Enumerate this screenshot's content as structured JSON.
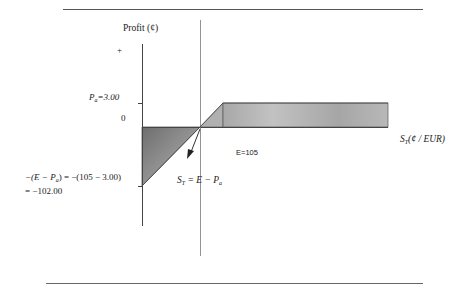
{
  "diagram": {
    "type": "option-payoff",
    "y_axis_label": "Profit (¢)",
    "plus_sign": "+",
    "premium_label": "P",
    "premium_sub": "a",
    "premium_value": "=3.00",
    "zero_label": "0",
    "strike_label": "E=105",
    "x_axis_label_S": "S",
    "x_axis_label_sub": "T",
    "x_axis_label_units": "(¢ / EUR)",
    "breakeven_lhs_S": "S",
    "breakeven_lhs_sub": "T",
    "breakeven_rhs": " = E − P",
    "breakeven_rhs_sub": "a",
    "max_loss_line1_a": "−(E − P",
    "max_loss_line1_sub": "a",
    "max_loss_line1_b": ") = −(105 − 3.00)",
    "max_loss_line2": "= −102.00",
    "strike": 105,
    "premium": 3.0,
    "max_loss": -102.0
  },
  "colors": {
    "rule": "#555555",
    "axis": "#444444",
    "shade_dark": "#8a8a8a",
    "shade_light": "#b4b4b4"
  }
}
